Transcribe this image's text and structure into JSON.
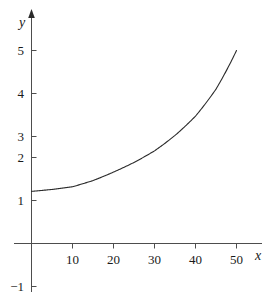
{
  "chart_data": {
    "type": "line",
    "title": "",
    "subtitle": "",
    "xlabel": "x",
    "ylabel": "y",
    "xlim": [
      -3,
      57
    ],
    "ylim": [
      -1.6,
      5.6
    ],
    "grid": false,
    "legend": null,
    "x_ticks": [
      10,
      20,
      30,
      40,
      50
    ],
    "x_tick_labels": [
      "10",
      "20",
      "30",
      "40",
      "50"
    ],
    "y_ticks": [
      -1,
      1,
      2,
      3,
      4,
      5
    ],
    "y_tick_labels": [
      "−1",
      "1",
      "2",
      "3",
      "4",
      "5"
    ],
    "series": [
      {
        "name": "curve",
        "color": "#2b2b2b",
        "x": [
          0,
          5,
          10,
          15,
          20,
          25,
          30,
          35,
          40,
          45,
          50
        ],
        "values": [
          1.35,
          1.4,
          1.47,
          1.63,
          1.85,
          2.1,
          2.4,
          2.8,
          3.3,
          4.0,
          5.0
        ]
      }
    ],
    "annotations": []
  },
  "axes": {
    "y_axis_name": "y",
    "x_axis_name": "x",
    "y_tick_labels": [
      "5",
      "4",
      "3",
      "2",
      "1",
      "−1"
    ],
    "x_tick_labels": [
      "10",
      "20",
      "30",
      "40",
      "50"
    ]
  },
  "colors": {
    "axis": "#4d4d4d",
    "curve": "#2b2b2b",
    "text": "#1a1a1a",
    "background": "#ffffff"
  }
}
